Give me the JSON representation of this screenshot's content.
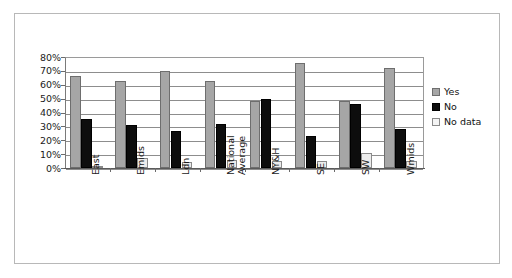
{
  "chart_data": {
    "type": "bar",
    "title": "",
    "subtitle": "",
    "xlabel": "",
    "ylabel": "",
    "ylim": [
      0,
      80
    ],
    "ytick_labels": [
      "80%",
      "70%",
      "60%",
      "50%",
      "40%",
      "30%",
      "20%",
      "10%",
      "0%"
    ],
    "ytick_values": [
      80,
      70,
      60,
      50,
      40,
      30,
      20,
      10,
      0
    ],
    "grid": true,
    "legend_position": "right",
    "categories": [
      "East",
      "Emids",
      "Ldn",
      "National\nAverage",
      "NY&H",
      "SE",
      "SW",
      "Wmids"
    ],
    "series": [
      {
        "name": "Yes",
        "color": "#a6a6a6",
        "values": [
          66,
          63,
          70,
          63,
          48,
          76,
          48,
          72
        ]
      },
      {
        "name": "No",
        "color": "#0d0d0d",
        "values": [
          35,
          31,
          27,
          32,
          50,
          23,
          46,
          28
        ]
      },
      {
        "name": "No data",
        "color": "#ececec",
        "values": [
          1,
          7,
          4,
          6,
          5,
          5,
          11,
          5
        ]
      }
    ]
  },
  "legend": {
    "items": [
      {
        "label": "Yes",
        "swatch": "yes"
      },
      {
        "label": "No",
        "swatch": "no"
      },
      {
        "label": "No data",
        "swatch": "nodata"
      }
    ]
  }
}
